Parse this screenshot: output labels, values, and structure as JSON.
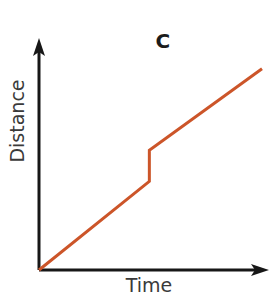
{
  "chart_data": {
    "type": "line",
    "title": "C",
    "xlabel": "Time",
    "ylabel": "Distance",
    "grid": false,
    "legend": null,
    "xlim": [
      0,
      100
    ],
    "ylim": [
      0,
      100
    ],
    "axis_ticks": {
      "x": [],
      "y": []
    },
    "series": [
      {
        "name": "Distance vs Time",
        "color": "#cc5529",
        "x": [
          0,
          48,
          48,
          97
        ],
        "y": [
          0,
          37,
          50,
          84
        ],
        "points": [
          {
            "x": 0,
            "y": 0,
            "note": "origin"
          },
          {
            "x": 48,
            "y": 37,
            "note": "end of first linear segment"
          },
          {
            "x": 48,
            "y": 50,
            "note": "top of vertical jump"
          },
          {
            "x": 97,
            "y": 84,
            "note": "end of second linear segment"
          }
        ]
      }
    ]
  },
  "figure": {
    "title": "C",
    "x_axis_label": "Time",
    "y_axis_label": "Distance",
    "line_color": "#cc5529",
    "axis_color": "#171717"
  },
  "geometry": {
    "origin_px": {
      "x": 39,
      "y": 270
    },
    "y_axis_top_px": 42,
    "x_axis_right_px": 268,
    "jump_x_px": 149,
    "jump_bottom_px": 185,
    "jump_top_px": 155,
    "line_end_px": {
      "x": 262,
      "y": 78
    }
  }
}
